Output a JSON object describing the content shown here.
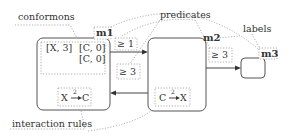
{
  "annotations": {
    "conformons": "conformons",
    "predicates": "predicates",
    "labels": "labels",
    "interaction_rules": "interaction rules"
  },
  "modules": [
    {
      "id": "m1",
      "label": "m1",
      "conformons": [
        "[X, 3]",
        "[C, 0]",
        "[C, 0]"
      ],
      "rule": {
        "from": "X",
        "to": "C",
        "weight": "2"
      }
    },
    {
      "id": "m2",
      "label": "m2",
      "rule": {
        "from": "C",
        "to": "X",
        "weight": "2"
      }
    },
    {
      "id": "m3",
      "label": "m3"
    }
  ],
  "edges": [
    {
      "from": "m1",
      "to": "m2",
      "predicate": "≥ 1"
    },
    {
      "from": "m2",
      "to": "m1",
      "predicate": "≥ 3"
    },
    {
      "from": "m2",
      "to": "m3",
      "predicate": "≥ 3"
    }
  ],
  "colors": {
    "box_stroke": "#555555",
    "dotted": "#9a9a9a",
    "text": "#333333"
  }
}
